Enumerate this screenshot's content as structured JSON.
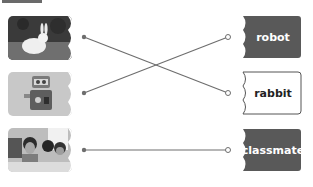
{
  "exercise": {
    "type": "match-picture-to-word",
    "pictures": [
      {
        "id": "p1",
        "name": "rabbit-photo",
        "depicts": "rabbit"
      },
      {
        "id": "p2",
        "name": "robot-photo",
        "depicts": "robot"
      },
      {
        "id": "p3",
        "name": "classmates-photo",
        "depicts": "classmate"
      }
    ],
    "words": [
      {
        "id": "w1",
        "label": "robot",
        "style": "dark"
      },
      {
        "id": "w2",
        "label": "rabbit",
        "style": "light"
      },
      {
        "id": "w3",
        "label": "classmate",
        "style": "dark"
      }
    ],
    "connections": [
      {
        "from": "p1",
        "to": "w2"
      },
      {
        "from": "p2",
        "to": "w1"
      },
      {
        "from": "p3",
        "to": "w3"
      }
    ]
  },
  "colors": {
    "line": "#6e6e6e",
    "dark_tab": "#595959",
    "light_tab_border": "#555555"
  }
}
